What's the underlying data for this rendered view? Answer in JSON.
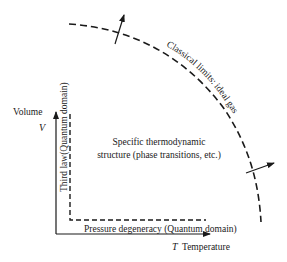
{
  "diagram": {
    "axes": {
      "y_label": "Volume",
      "y_symbol": "V",
      "x_symbol": "T",
      "x_label": "Temperature"
    },
    "regions": {
      "classical_limit": "Classical limits: ideal gas",
      "third_law": "Third law(Quantum domain)",
      "pressure_degeneracy": "Pressure degeneracy (Quantum domain)",
      "center_line1": "Specific thermodynamic",
      "center_line2": "structure (phase transitions, etc.)"
    },
    "colors": {
      "ink": "#1a1a1a",
      "background": "#ffffff"
    }
  }
}
